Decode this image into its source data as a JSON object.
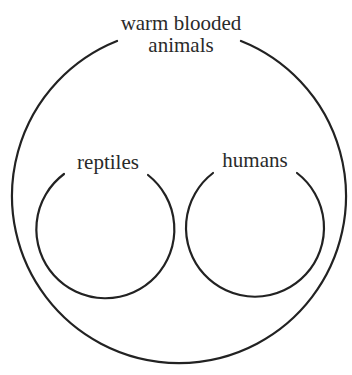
{
  "diagram": {
    "type": "venn-subset",
    "stroke_color": "#222222",
    "background_color": "#ffffff",
    "outer_set": {
      "label_line1": "warm blooded",
      "label_line2": "animals"
    },
    "inner_sets": [
      {
        "label": "reptiles"
      },
      {
        "label": "humans"
      }
    ]
  }
}
